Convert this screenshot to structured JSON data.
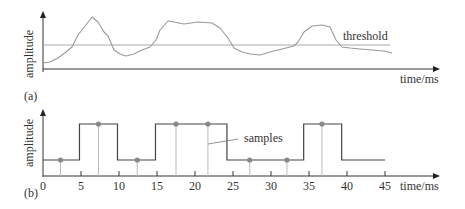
{
  "panel_a": {
    "label": "(a)",
    "ylabel": "amplitude",
    "xlabel": "time/ms",
    "threshold_label": "threshold",
    "signal_points": [
      [
        43,
        63
      ],
      [
        50,
        62
      ],
      [
        58,
        58
      ],
      [
        66,
        52
      ],
      [
        72,
        47
      ],
      [
        78,
        35
      ],
      [
        86,
        25
      ],
      [
        92,
        17
      ],
      [
        98,
        22
      ],
      [
        104,
        32
      ],
      [
        108,
        36
      ],
      [
        114,
        50
      ],
      [
        120,
        54
      ],
      [
        126,
        56
      ],
      [
        134,
        54
      ],
      [
        142,
        50
      ],
      [
        150,
        47
      ],
      [
        156,
        40
      ],
      [
        160,
        30
      ],
      [
        168,
        21
      ],
      [
        174,
        22
      ],
      [
        184,
        24
      ],
      [
        198,
        22
      ],
      [
        212,
        23
      ],
      [
        220,
        28
      ],
      [
        228,
        38
      ],
      [
        234,
        48
      ],
      [
        242,
        52
      ],
      [
        250,
        54
      ],
      [
        260,
        55
      ],
      [
        270,
        52
      ],
      [
        282,
        49
      ],
      [
        294,
        46
      ],
      [
        298,
        42
      ],
      [
        304,
        32
      ],
      [
        312,
        26
      ],
      [
        322,
        25
      ],
      [
        330,
        27
      ],
      [
        336,
        40
      ],
      [
        342,
        47
      ],
      [
        350,
        48
      ],
      [
        360,
        49
      ],
      [
        372,
        50
      ],
      [
        384,
        51
      ],
      [
        392,
        53
      ]
    ]
  },
  "panel_b": {
    "label": "(b)",
    "ylabel": "amplitude",
    "xlabel": "time/ms",
    "samples_label": "samples",
    "x_ticks": [
      "0",
      "5",
      "10",
      "15",
      "20",
      "25",
      "30",
      "35",
      "40",
      "45"
    ],
    "levels": {
      "low": 0,
      "high": 1
    },
    "square_wave": [
      {
        "t0": 0,
        "t1": 4.8,
        "level": "low"
      },
      {
        "t0": 4.8,
        "t1": 9.8,
        "level": "high"
      },
      {
        "t0": 9.8,
        "t1": 14.8,
        "level": "low"
      },
      {
        "t0": 14.8,
        "t1": 24.2,
        "level": "high"
      },
      {
        "t0": 24.2,
        "t1": 34.3,
        "level": "low"
      },
      {
        "t0": 34.3,
        "t1": 39.3,
        "level": "high"
      },
      {
        "t0": 39.3,
        "t1": 45,
        "level": "low"
      }
    ],
    "samples": [
      {
        "t": 2.3,
        "level": "low"
      },
      {
        "t": 7.3,
        "level": "high"
      },
      {
        "t": 12.4,
        "level": "low"
      },
      {
        "t": 17.5,
        "level": "high"
      },
      {
        "t": 21.7,
        "level": "high"
      },
      {
        "t": 27.2,
        "level": "low"
      },
      {
        "t": 32.1,
        "level": "low"
      },
      {
        "t": 36.7,
        "level": "high"
      }
    ]
  },
  "colors": {
    "axis": "#333333",
    "signal": "#9a9a9a",
    "threshold": "#aaaaaa",
    "square": "#444444",
    "stem": "#bbbbbb",
    "dot": "#888888"
  }
}
